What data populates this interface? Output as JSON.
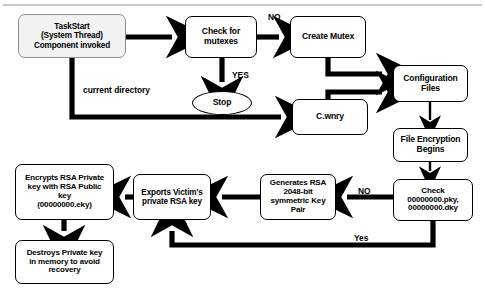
{
  "diagram": {
    "canvas": {
      "width": 485,
      "height": 302
    },
    "colors": {
      "background": "#ffffff",
      "stroke": "#000000",
      "start_fill": "#f2f2f2",
      "start_stroke": "#8d8d8d",
      "rule": "#c8c8c8"
    },
    "nodes": [
      {
        "id": "task-start",
        "name": "task-start-node",
        "label": "TaskStart\n(System Thread)\nComponent invoked",
        "shape": "rounded-rect",
        "x": 18,
        "y": 14,
        "w": 108,
        "h": 44,
        "font_size": 8.2
      },
      {
        "id": "check-mutexes",
        "name": "check-for-mutexes-node",
        "label": "Check for\nmutexes",
        "shape": "rounded-rect",
        "x": 185,
        "y": 16,
        "w": 72,
        "h": 42,
        "font_size": 8.6
      },
      {
        "id": "stop",
        "name": "stop-terminator-node",
        "label": "Stop",
        "shape": "ellipse",
        "x": 192,
        "y": 91,
        "w": 60,
        "h": 24,
        "font_size": 8.6
      },
      {
        "id": "create-mutex",
        "name": "create-mutex-node",
        "label": "Create Mutex",
        "shape": "rounded-rect",
        "x": 290,
        "y": 16,
        "w": 76,
        "h": 42,
        "font_size": 8.6
      },
      {
        "id": "cwnry",
        "name": "c-wnry-node",
        "label": "C.wnry",
        "shape": "rounded-rect",
        "x": 292,
        "y": 99,
        "w": 76,
        "h": 36,
        "font_size": 8.6
      },
      {
        "id": "configuration-files",
        "name": "configuration-files-node",
        "label": "Configuration\nFiles",
        "shape": "rounded-rect",
        "x": 393,
        "y": 65,
        "w": 75,
        "h": 37,
        "font_size": 8.6
      },
      {
        "id": "file-encryption-begins",
        "name": "file-encryption-begins-node",
        "label": "File Encryption\nBegins",
        "shape": "rounded-rect",
        "x": 393,
        "y": 128,
        "w": 75,
        "h": 34,
        "font_size": 8.6
      },
      {
        "id": "check-keys",
        "name": "check-key-files-node",
        "label": "Check\n00000000.pky,\n00000000.dky",
        "shape": "rounded-rect",
        "x": 393,
        "y": 179,
        "w": 80,
        "h": 42,
        "font_size": 8.0
      },
      {
        "id": "generates-rsa",
        "name": "generates-rsa-key-pair-node",
        "label": "Generates RSA\n2048-bit\nsymmetric Key\nPair",
        "shape": "rounded-rect",
        "x": 260,
        "y": 174,
        "w": 76,
        "h": 46,
        "font_size": 8.0
      },
      {
        "id": "exports-victim",
        "name": "exports-victim-private-key-node",
        "label": "Exports Victim's\nprivate RSA key",
        "shape": "rounded-rect",
        "x": 133,
        "y": 174,
        "w": 78,
        "h": 46,
        "font_size": 8.2
      },
      {
        "id": "encrypts-rsa",
        "name": "encrypts-rsa-private-key-node",
        "label": "Encrypts RSA Private\nkey with  RSA Public\nkey\n(00000000.eky)",
        "shape": "rounded-rect",
        "x": 15,
        "y": 164,
        "w": 99,
        "h": 56,
        "font_size": 8.0
      },
      {
        "id": "destroys-key",
        "name": "destroys-private-key-node",
        "label": "Destroys Private key\nin memory to avoid\nrecovery",
        "shape": "rounded-rect",
        "x": 15,
        "y": 240,
        "w": 99,
        "h": 44,
        "font_size": 8.0
      }
    ],
    "edge_labels": [
      {
        "id": "lbl-no-mutex",
        "name": "edge-label-no-mutex",
        "text": "NO",
        "x": 268,
        "y": 12,
        "font_size": 8.4
      },
      {
        "id": "lbl-yes-mutex",
        "name": "edge-label-yes-mutex",
        "text": "YES",
        "x": 232,
        "y": 70,
        "font_size": 8.4
      },
      {
        "id": "lbl-curdir",
        "name": "edge-label-current-directory",
        "text": "current directory",
        "x": 83,
        "y": 85,
        "font_size": 8.4
      },
      {
        "id": "lbl-no-keys",
        "name": "edge-label-no-keys",
        "text": "NO",
        "x": 358,
        "y": 186,
        "font_size": 8.4
      },
      {
        "id": "lbl-yes-keys",
        "name": "edge-label-yes-keys",
        "text": "Yes",
        "x": 354,
        "y": 233,
        "font_size": 8.4
      }
    ],
    "edges": [
      {
        "id": "e1",
        "name": "edge-taskstart-to-checkmutexes",
        "from": "task-start",
        "to": "check-mutexes",
        "style": "thick-straight"
      },
      {
        "id": "e2",
        "name": "edge-checkmutexes-to-createmutex",
        "from": "check-mutexes",
        "to": "create-mutex",
        "style": "thick-straight",
        "label": "NO"
      },
      {
        "id": "e3",
        "name": "edge-checkmutexes-to-stop",
        "from": "check-mutexes",
        "to": "stop",
        "style": "thick-straight",
        "label": "YES"
      },
      {
        "id": "e4",
        "name": "edge-taskstart-to-cwnry",
        "from": "task-start",
        "to": "cwnry",
        "style": "thick-elbow",
        "label": "current directory"
      },
      {
        "id": "e5",
        "name": "edge-createmutex-to-configfiles",
        "from": "create-mutex",
        "to": "configuration-files",
        "style": "thick-elbow"
      },
      {
        "id": "e6",
        "name": "edge-cwnry-to-configfiles",
        "from": "cwnry",
        "to": "configuration-files",
        "style": "thick-elbow"
      },
      {
        "id": "e7",
        "name": "edge-configfiles-to-fileencryption",
        "from": "configuration-files",
        "to": "file-encryption-begins",
        "style": "thin-straight"
      },
      {
        "id": "e8",
        "name": "edge-fileencryption-to-checkkeys",
        "from": "file-encryption-begins",
        "to": "check-keys",
        "style": "thin-straight"
      },
      {
        "id": "e9",
        "name": "edge-checkkeys-to-generatesrsa",
        "from": "check-keys",
        "to": "generates-rsa",
        "style": "thick-straight",
        "label": "NO"
      },
      {
        "id": "e10",
        "name": "edge-generatesrsa-to-exportsvictim",
        "from": "generates-rsa",
        "to": "exports-victim",
        "style": "thick-straight"
      },
      {
        "id": "e11",
        "name": "edge-exportsvictim-to-encryptsrsa",
        "from": "exports-victim",
        "to": "encrypts-rsa",
        "style": "thick-straight"
      },
      {
        "id": "e12",
        "name": "edge-encryptsrsa-to-destroyskey",
        "from": "encrypts-rsa",
        "to": "destroys-key",
        "style": "thick-straight"
      },
      {
        "id": "e13",
        "name": "edge-checkkeys-yes-to-exportsvictim",
        "from": "check-keys",
        "to": "exports-victim",
        "style": "thick-elbow",
        "label": "Yes"
      }
    ]
  }
}
